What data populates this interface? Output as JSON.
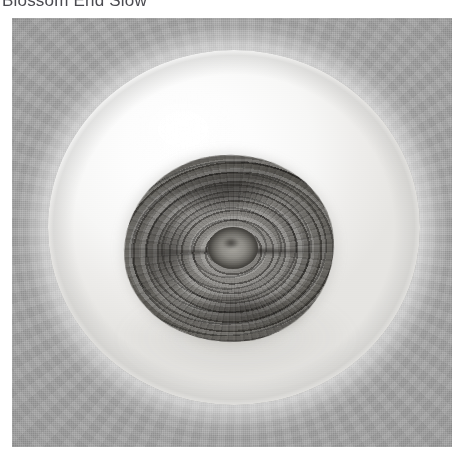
{
  "caption": {
    "title": "Blossom End Slow"
  },
  "figure": {
    "alt_label": "grayscale specimen photograph",
    "background_color": "#9b9b9b",
    "halo_color": "#fdfdfd",
    "specimen_color": "#6d6b67",
    "panel": {
      "left": 12,
      "top": 18,
      "width": 440,
      "height": 429
    }
  }
}
